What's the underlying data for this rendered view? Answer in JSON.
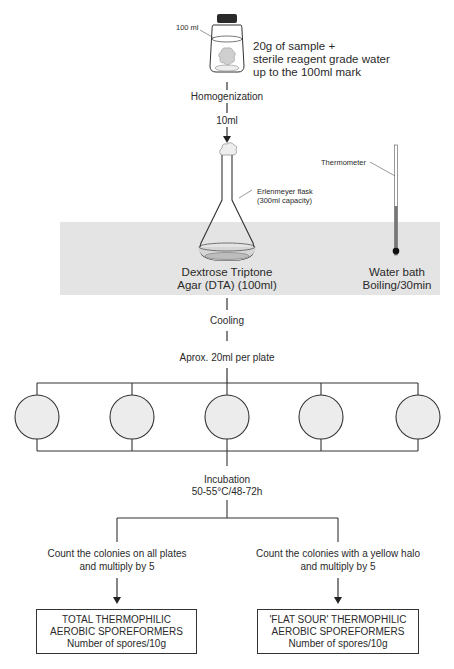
{
  "diagram": {
    "bottle": {
      "mark_label": "100 ml",
      "description_lines": [
        "20g of sample +",
        "sterile reagent grade water",
        "up to the 100ml mark"
      ]
    },
    "steps": {
      "homogenization": "Homogenization",
      "transfer": "10ml",
      "cooling": "Cooling",
      "plating": "Aprox. 20ml per plate",
      "incubation_lines": [
        "Incubation",
        "50-55°C/48-72h"
      ]
    },
    "flask": {
      "callout_lines": [
        "Erlenmeyer flask",
        "(300ml capacity)"
      ],
      "medium_lines": [
        "Dextrose Triptone",
        "Agar (DTA) (100ml)"
      ]
    },
    "water_bath": {
      "thermometer_label": "Thermometer",
      "label_lines": [
        "Water bath",
        "Boiling/30min"
      ]
    },
    "plates": {
      "count": 5
    },
    "branches": [
      {
        "instruction_lines": [
          "Count the colonies on all plates",
          "and multiply by 5"
        ],
        "result_lines": [
          "TOTAL THERMOPHILIC",
          "AEROBIC SPOREFORMERS",
          "Number of spores/10g"
        ]
      },
      {
        "instruction_lines": [
          "Count the colonies with a yellow halo",
          "and multiply by 5"
        ],
        "result_lines": [
          "'FLAT SOUR' THERMOPHILIC",
          "AEROBIC SPOREFORMERS",
          "Number of spores/10g"
        ]
      }
    ],
    "colors": {
      "line": "#333333",
      "bath": "#e4e4e4",
      "plate_fill": "#ececec",
      "liquid": "#d6d6d6"
    }
  }
}
